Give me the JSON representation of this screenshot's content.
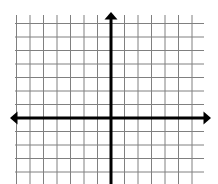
{
  "canvas": {
    "width": 218,
    "height": 184,
    "background_color": "#ffffff"
  },
  "chart_data": {
    "type": "grid",
    "title": "",
    "subtitle": "",
    "xlabel": "",
    "ylabel": "",
    "grid": true,
    "grid_visible": true,
    "grid_color": "#808080",
    "grid_line_width": 1,
    "cell_size_px": 13.5,
    "columns": 14,
    "rows": 13,
    "columns_left_of_axis": 7,
    "columns_right_of_axis": 7,
    "rows_above_axis": 7,
    "rows_below_axis": 6,
    "xlim": [
      -7,
      7
    ],
    "ylim": [
      -6,
      7
    ],
    "xticks": [],
    "yticks": [],
    "xtick_labels": [],
    "ytick_labels": [],
    "legend": [],
    "annotations": [],
    "series": [],
    "values": [],
    "categories": [],
    "origin_px": {
      "x": 111,
      "y": 118
    },
    "plot_area_px": {
      "left": 15,
      "top": 15,
      "right": 204,
      "bottom": 184
    },
    "axes": {
      "color": "#000000",
      "line_width": 3,
      "arrowheads": "both-ends",
      "x_axis": {
        "name": "x-axis",
        "y_px": 118,
        "start_px": 10,
        "end_px": 211,
        "arrow_left": true,
        "arrow_right": true,
        "label": ""
      },
      "y_axis": {
        "name": "y-axis",
        "x_px": 111,
        "start_px": 12,
        "end_px": 184,
        "arrow_up": true,
        "arrow_down": false,
        "label": ""
      }
    }
  }
}
